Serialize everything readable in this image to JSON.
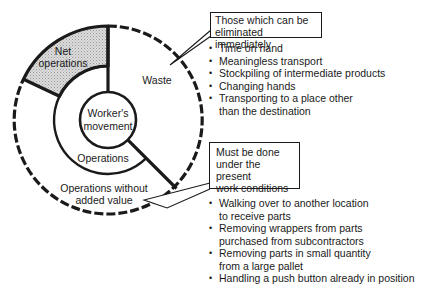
{
  "diagram": {
    "center_label_line1": "Worker's",
    "center_label_line2": "movement",
    "segments": {
      "net_operations_line1": "Net",
      "net_operations_line2": "operations",
      "waste": "Waste",
      "operations": "Operations",
      "operations_without_added_value_line1": "Operations without",
      "operations_without_added_value_line2": "added value"
    },
    "colors": {
      "line": "#1a1a1a",
      "net_operations_fill": "#d4d4d4",
      "background": "#ffffff"
    }
  },
  "callouts": [
    {
      "title_line1": "Those which can be",
      "title_line2": "eliminated immediately",
      "items": [
        "Time on hand",
        "Meaningless transport",
        "Stockpiling of intermediate products",
        "Changing hands",
        "Transporting to a place other than the destination"
      ]
    },
    {
      "title_line1": "Must be done",
      "title_line2": "under the present",
      "title_line3": "work conditions",
      "items": [
        "Walking over to another location to receive parts",
        "Removing wrappers from parts purchased from subcontractors",
        "Removing parts in small quantity from a large pallet",
        "Handling a push button already in position"
      ]
    }
  ]
}
